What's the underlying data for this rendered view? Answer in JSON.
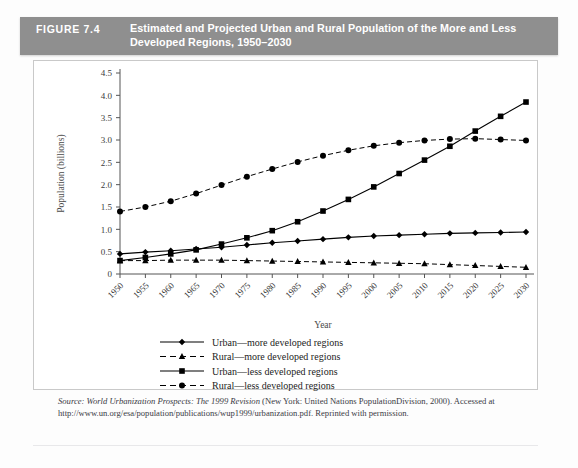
{
  "banner": {
    "figure_number": "FIGURE 7.4",
    "title_line1": "Estimated and Projected Urban and Rural Population of the More and Less",
    "title_line2": "Developed Regions, 1950–2030",
    "background_color": "#8f8f8f",
    "text_color": "#ffffff"
  },
  "source": {
    "prefix": "Source:",
    "italic_part": "World Urbanization Prospects: The 1999 Revision",
    "rest": "(New York: United Nations PopulationDivision, 2000). Accessed at http://www.un.org/esa/population/publications/wup1999/urbanization.pdf. Reprinted with permission."
  },
  "chart_data": {
    "type": "line",
    "title": "Estimated and Projected Urban and Rural Population of the More and Less Developed Regions, 1950–2030",
    "xlabel": "Year",
    "ylabel": "Population (billions)",
    "categories": [
      "1950",
      "1955",
      "1960",
      "1965",
      "1970",
      "1975",
      "1980",
      "1985",
      "1990",
      "1995",
      "2000",
      "2005",
      "2010",
      "2015",
      "2020",
      "2025",
      "2030"
    ],
    "x": [
      1950,
      1955,
      1960,
      1965,
      1970,
      1975,
      1980,
      1985,
      1990,
      1995,
      2000,
      2005,
      2010,
      2015,
      2020,
      2025,
      2030
    ],
    "ylim": [
      0,
      4.5
    ],
    "ytick_labels": [
      "0",
      "0.5",
      "1.0",
      "1.5",
      "2.0",
      "2.5",
      "3.0",
      "3.5",
      "4.0",
      "4.5"
    ],
    "ytick_values": [
      0,
      0.5,
      1.0,
      1.5,
      2.0,
      2.5,
      3.0,
      3.5,
      4.0,
      4.5
    ],
    "grid": false,
    "legend_position": "below-axes",
    "series": [
      {
        "name": "Urban—more developed regions",
        "marker": "diamond",
        "line_style": "solid",
        "color": "#000000",
        "values": [
          0.45,
          0.49,
          0.52,
          0.56,
          0.6,
          0.65,
          0.7,
          0.74,
          0.78,
          0.82,
          0.85,
          0.87,
          0.89,
          0.91,
          0.92,
          0.93,
          0.94
        ]
      },
      {
        "name": "Rural—more developed regions",
        "marker": "triangle",
        "line_style": "dashed",
        "color": "#000000",
        "values": [
          0.3,
          0.3,
          0.31,
          0.31,
          0.31,
          0.3,
          0.29,
          0.28,
          0.27,
          0.26,
          0.25,
          0.24,
          0.23,
          0.21,
          0.19,
          0.17,
          0.15
        ]
      },
      {
        "name": "Urban—less developed regions",
        "marker": "square",
        "line_style": "solid",
        "color": "#000000",
        "values": [
          0.3,
          0.37,
          0.45,
          0.54,
          0.67,
          0.81,
          0.97,
          1.17,
          1.41,
          1.67,
          1.95,
          2.25,
          2.55,
          2.86,
          3.2,
          3.53,
          3.85
        ]
      },
      {
        "name": "Rural—less developed regions",
        "marker": "circle",
        "line_style": "dashed",
        "color": "#000000",
        "values": [
          1.4,
          1.5,
          1.63,
          1.8,
          1.99,
          2.18,
          2.35,
          2.51,
          2.65,
          2.77,
          2.87,
          2.94,
          2.99,
          3.02,
          3.03,
          3.01,
          2.99
        ]
      }
    ]
  }
}
